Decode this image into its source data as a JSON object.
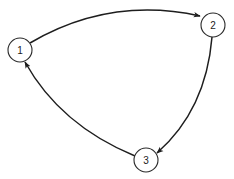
{
  "diagram": {
    "type": "directed-cycle-graph",
    "nodes": [
      {
        "id": "1",
        "label": "1"
      },
      {
        "id": "2",
        "label": "2"
      },
      {
        "id": "3",
        "label": "3"
      }
    ],
    "edges": [
      {
        "from": "1",
        "to": "2",
        "directed": true
      },
      {
        "from": "2",
        "to": "3",
        "directed": true
      },
      {
        "from": "3",
        "to": "1",
        "directed": true
      }
    ],
    "colors": {
      "stroke": "#1e1e1e",
      "background": "#ffffff"
    }
  }
}
